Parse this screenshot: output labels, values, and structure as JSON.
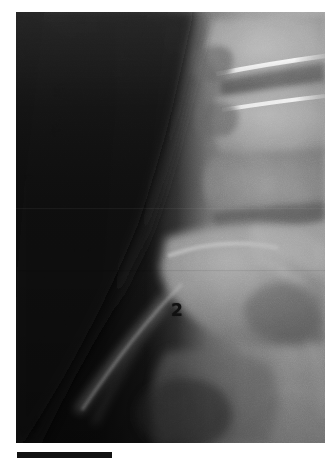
{
  "document": {
    "kind": "radiograph",
    "modality": "X-ray",
    "view": "lateral",
    "region": "lumbosacral spine",
    "background_color": "#ffffff"
  },
  "image_panel": {
    "name": "lateral lumbosacral spine radiograph",
    "x": 16,
    "y": 12,
    "width": 309,
    "height": 431,
    "soft_tissue_color": "#0a0a0a",
    "bone_midtone_color": "#8a8a8a",
    "bone_bright_color": "#b0b0b0",
    "cortical_line_color": "#e8e8e8",
    "disc_space_color": "#5a5a5a"
  },
  "annotations": [
    {
      "id": "marker-2",
      "text": "2",
      "x": 171,
      "y": 302,
      "color": "#111111",
      "description": "numeric marker over lumbosacral vertebral body"
    }
  ],
  "scale_bar": {
    "name": "scale-bar",
    "x": 17,
    "y": 452,
    "width": 95,
    "height": 6,
    "color": "#121212",
    "label": ""
  },
  "anatomy_regions": [
    {
      "name": "vertebral-body-upper",
      "label": "upper lumbar vertebral body"
    },
    {
      "name": "vertebral-body-middle",
      "label": "middle lumbar vertebral body"
    },
    {
      "name": "vertebral-body-lower",
      "label": "lower lumbar vertebral body"
    },
    {
      "name": "intervertebral-disc-space-upper",
      "label": "upper disc space"
    },
    {
      "name": "intervertebral-disc-space-lower",
      "label": "lower disc space"
    },
    {
      "name": "spinous-process",
      "label": "spinous process"
    },
    {
      "name": "facet-joint",
      "label": "facet joint"
    },
    {
      "name": "sacrum",
      "label": "sacrum"
    },
    {
      "name": "soft-tissue-shadow",
      "label": "anterior soft tissue shadow"
    }
  ]
}
